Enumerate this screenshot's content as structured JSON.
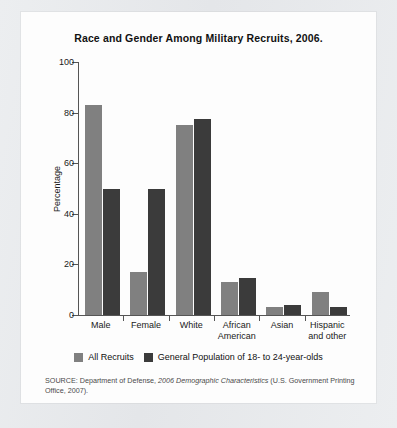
{
  "figure": {
    "title": "Race and Gender Among Military Recruits, 2006.",
    "source_prefix": "SOURCE: Department of Defense, ",
    "source_italic": "2006 Demographic Characteristics",
    "source_suffix": " (U.S. Government Printing Office, 2007)."
  },
  "colors": {
    "series_1": "#808080",
    "series_2": "#3b3b3b",
    "axis": "#555555",
    "card_background": "#fdfdfd",
    "page_background": "#e9eaec"
  },
  "chart_data": {
    "type": "bar",
    "title": "Race and Gender Among Military Recruits, 2006.",
    "xlabel": "",
    "ylabel": "Percentage",
    "ylim": [
      0,
      100
    ],
    "yticks": [
      0,
      20,
      40,
      60,
      80,
      100
    ],
    "grid": false,
    "legend_position": "bottom",
    "categories": [
      "Male",
      "Female",
      "White",
      "African American",
      "Asian",
      "Hispanic and other"
    ],
    "category_lines": [
      [
        "Male"
      ],
      [
        "Female"
      ],
      [
        "White"
      ],
      [
        "African",
        "American"
      ],
      [
        "Asian"
      ],
      [
        "Hispanic",
        "and other"
      ]
    ],
    "series": [
      {
        "name": "All Recruits",
        "color": "#808080",
        "values": [
          83,
          17,
          75,
          13,
          3,
          9
        ]
      },
      {
        "name": "General Population of 18- to 24-year-olds",
        "color": "#3b3b3b",
        "values": [
          50,
          50,
          77.5,
          14.5,
          4,
          3
        ]
      }
    ]
  }
}
